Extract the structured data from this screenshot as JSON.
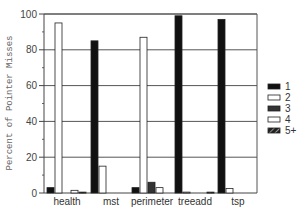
{
  "chart_data": {
    "type": "bar",
    "title": "",
    "xlabel": "",
    "ylabel": "Percent of Pointer Misses",
    "ylim": [
      0,
      100
    ],
    "yticks": [
      0,
      20,
      40,
      60,
      80,
      100
    ],
    "grid": true,
    "legend_position": "right",
    "categories": [
      "health",
      "mst",
      "perimeter",
      "treeadd",
      "tsp"
    ],
    "series": [
      {
        "name": "1",
        "style": "solid-black",
        "values": [
          3,
          85,
          3,
          99,
          97
        ]
      },
      {
        "name": "2",
        "style": "white",
        "values": [
          95,
          15,
          87,
          0.5,
          2.5
        ]
      },
      {
        "name": "3",
        "style": "dark-gray",
        "values": [
          0,
          0,
          6,
          0,
          0
        ]
      },
      {
        "name": "4",
        "style": "white",
        "values": [
          1.5,
          0,
          3,
          0,
          0
        ]
      },
      {
        "name": "5+",
        "style": "hatched",
        "values": [
          0.5,
          0,
          0,
          0.5,
          0
        ]
      }
    ]
  },
  "colors": {
    "series1": "#111111",
    "series2": "#ffffff",
    "series3": "#333333",
    "series4": "#ffffff",
    "series5": "#222222",
    "grid": "#555555"
  }
}
